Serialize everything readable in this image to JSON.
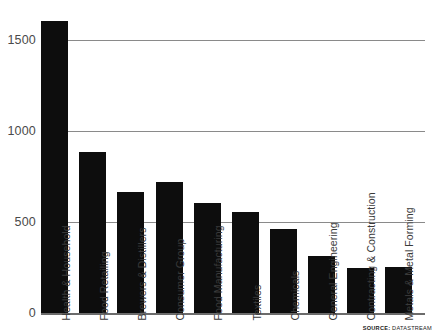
{
  "chart_data": {
    "type": "bar",
    "title": "",
    "subtitle": "",
    "xlabel": "",
    "ylabel": "",
    "ylim": [
      0,
      1700
    ],
    "yticks": [
      0,
      500,
      1000,
      1500
    ],
    "ytick_labels": [
      "0",
      "500",
      "1000",
      "1500"
    ],
    "grid": true,
    "legend": null,
    "orientation": "vertical",
    "bar_color": "#0d0d0d",
    "categories": [
      "Health & Household",
      "Food Retailing",
      "Brewers & Distillers",
      "Consumer Group",
      "Food Manufacturing",
      "Textiles",
      "Chemicals",
      "General Engineering",
      "Contracting & Construction",
      "Metals & Metal Forming"
    ],
    "values": [
      1605,
      885,
      665,
      720,
      605,
      555,
      460,
      315,
      245,
      255
    ],
    "annotations": []
  },
  "source": {
    "key": "SOURCE:",
    "value": "DATASTREAM"
  }
}
